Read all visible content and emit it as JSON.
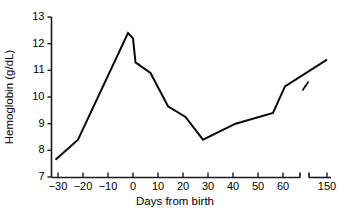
{
  "chart_data": {
    "type": "line",
    "title": "",
    "xlabel": "Days from birth",
    "ylabel": "Hemoglobin (g/dL)",
    "ylim": [
      7,
      13
    ],
    "xlim": [
      -33,
      155
    ],
    "grid": false,
    "legend": null,
    "x_tick_labels": [
      "−30",
      "−20",
      "−10",
      "0",
      "10",
      "20",
      "30",
      "40",
      "50",
      "60",
      "150"
    ],
    "x_tick_values": [
      -30,
      -20,
      -10,
      0,
      10,
      20,
      30,
      40,
      50,
      60,
      150
    ],
    "y_tick_labels": [
      "7",
      "8",
      "9",
      "10",
      "11",
      "12",
      "13"
    ],
    "y_tick_values": [
      7,
      8,
      9,
      10,
      11,
      12,
      13
    ],
    "axis_break": {
      "present": true,
      "between": [
        60,
        150
      ],
      "note": "x-axis compressed after 60 days"
    },
    "series": [
      {
        "name": "Hemoglobin",
        "color": "#0a0a0a",
        "x": [
          -31,
          -22,
          -2,
          0,
          1,
          7,
          14,
          21,
          28,
          41,
          56,
          64,
          150
        ],
        "values": [
          7.65,
          8.4,
          12.4,
          12.2,
          11.3,
          10.9,
          9.65,
          9.25,
          8.4,
          9.0,
          9.4,
          10.4,
          11.4
        ]
      }
    ]
  },
  "axes": {
    "y_title": "Hemoglobin (g/dL)",
    "x_title": "Days from birth"
  }
}
